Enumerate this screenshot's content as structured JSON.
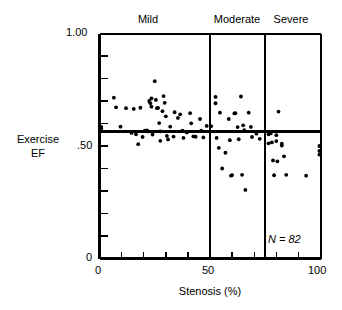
{
  "chart_data": {
    "type": "scatter",
    "title": "",
    "xlabel": "Stenosis (%)",
    "ylabel": "Exercise EF",
    "xlim": [
      0,
      100
    ],
    "ylim": [
      0,
      1.0
    ],
    "xticks": [
      0,
      50,
      100
    ],
    "xtick_labels": [
      "0",
      "50",
      "100"
    ],
    "x_minor_ticks": [
      10,
      20,
      30,
      40,
      60,
      70,
      80,
      90
    ],
    "yticks": [
      0,
      1.0
    ],
    "ytick_labels_visible": [
      "1.00",
      ".50",
      "0"
    ],
    "ytick_label_values": [
      1.0,
      0.5,
      0.0
    ],
    "y_minor_ticks": [
      0.1,
      0.2,
      0.3,
      0.4,
      0.5,
      0.6,
      0.7,
      0.8,
      0.9
    ],
    "grid": false,
    "legend": "none",
    "annotations": [
      {
        "text": "N = 82",
        "x": 76,
        "y": 0.095,
        "style": "italic"
      }
    ],
    "reference_lines": [
      {
        "orientation": "horizontal",
        "value": 0.565,
        "label": "lower-limit-normal-exercise-EF"
      },
      {
        "orientation": "vertical",
        "value": 50,
        "label": "mild-moderate-boundary"
      },
      {
        "orientation": "vertical",
        "value": 75,
        "label": "moderate-severe-boundary"
      }
    ],
    "category_bands": [
      {
        "label": "Mild",
        "x_start": 0,
        "x_end": 50
      },
      {
        "label": "Moderate",
        "x_start": 50,
        "x_end": 75
      },
      {
        "label": "Severe",
        "x_start": 75,
        "x_end": 100
      }
    ],
    "series": [
      {
        "name": "patients",
        "marker": "filled-circle",
        "color": "#000000",
        "n": 82,
        "points": [
          [
            0.8,
            0.585
          ],
          [
            0.8,
            0.578
          ],
          [
            6.5,
            0.715
          ],
          [
            7.5,
            0.672
          ],
          [
            9.5,
            0.586
          ],
          [
            12.0,
            0.668
          ],
          [
            14.5,
            0.558
          ],
          [
            15.5,
            0.665
          ],
          [
            16.5,
            0.552
          ],
          [
            17.5,
            0.508
          ],
          [
            18.5,
            0.67
          ],
          [
            19.5,
            0.54
          ],
          [
            20.5,
            0.568
          ],
          [
            21.5,
            0.569
          ],
          [
            22.0,
            0.565
          ],
          [
            22.5,
            0.7
          ],
          [
            23.0,
            0.69
          ],
          [
            23.5,
            0.712
          ],
          [
            23.5,
            0.675
          ],
          [
            24.0,
            0.551
          ],
          [
            25.0,
            0.788
          ],
          [
            25.5,
            0.705
          ],
          [
            26.0,
            0.668
          ],
          [
            26.5,
            0.669
          ],
          [
            27.0,
            0.602
          ],
          [
            27.5,
            0.565
          ],
          [
            27.5,
            0.523
          ],
          [
            28.5,
            0.655
          ],
          [
            29.0,
            0.722
          ],
          [
            29.5,
            0.692
          ],
          [
            30.0,
            0.632
          ],
          [
            30.5,
            0.545
          ],
          [
            31.0,
            0.529
          ],
          [
            32.0,
            0.586
          ],
          [
            33.5,
            0.542
          ],
          [
            34.0,
            0.65
          ],
          [
            35.5,
            0.625
          ],
          [
            36.5,
            0.641
          ],
          [
            37.5,
            0.568
          ],
          [
            38.0,
            0.536
          ],
          [
            39.5,
            0.56
          ],
          [
            41.0,
            0.646
          ],
          [
            41.5,
            0.601
          ],
          [
            42.5,
            0.543
          ],
          [
            43.5,
            0.541
          ],
          [
            45.5,
            0.62
          ],
          [
            46.0,
            0.568
          ],
          [
            47.0,
            0.538
          ],
          [
            48.5,
            0.589
          ],
          [
            50.5,
            0.588
          ],
          [
            52.5,
            0.718
          ],
          [
            52.5,
            0.69
          ],
          [
            53.0,
            0.536
          ],
          [
            54.0,
            0.492
          ],
          [
            54.5,
            0.648
          ],
          [
            55.5,
            0.4
          ],
          [
            57.0,
            0.47
          ],
          [
            58.5,
            0.62
          ],
          [
            59.0,
            0.526
          ],
          [
            59.5,
            0.368
          ],
          [
            60.0,
            0.371
          ],
          [
            61.0,
            0.645
          ],
          [
            61.5,
            0.646
          ],
          [
            62.5,
            0.584
          ],
          [
            63.0,
            0.53
          ],
          [
            64.0,
            0.72
          ],
          [
            64.5,
            0.372
          ],
          [
            65.0,
            0.592
          ],
          [
            65.5,
            0.57
          ],
          [
            66.0,
            0.305
          ],
          [
            67.5,
            0.648
          ],
          [
            68.5,
            0.585
          ],
          [
            69.0,
            0.54
          ],
          [
            71.0,
            0.555
          ],
          [
            72.5,
            0.532
          ],
          [
            76.5,
            0.552
          ],
          [
            77.5,
            0.556
          ],
          [
            76.5,
            0.512
          ],
          [
            78.0,
            0.516
          ],
          [
            80.0,
            0.548
          ],
          [
            80.0,
            0.522
          ],
          [
            80.5,
            0.432
          ],
          [
            81.0,
            0.653
          ],
          [
            82.5,
            0.51
          ],
          [
            82.5,
            0.502
          ],
          [
            83.5,
            0.454
          ],
          [
            84.5,
            0.372
          ],
          [
            78.5,
            0.436
          ],
          [
            79.0,
            0.37
          ],
          [
            93.5,
            0.368
          ],
          [
            99.5,
            0.5
          ],
          [
            99.5,
            0.478
          ],
          [
            99.5,
            0.462
          ]
        ]
      }
    ]
  },
  "chart": {
    "cat_mild": "Mild",
    "cat_moderate": "Moderate",
    "cat_severe": "Severe",
    "ytop_label": "1.00",
    "ymid_label": ".50",
    "ybot_label": "0",
    "ylabel_line1": "Exercise",
    "ylabel_line2": "EF",
    "x0_label": "0",
    "x50_label": "50",
    "x100_label": "100",
    "xaxis_title": "Stenosis (%)",
    "n_annotation": "N = 82"
  },
  "colors": {
    "axis": "#000000",
    "marker": "#000000",
    "background": "#ffffff"
  }
}
